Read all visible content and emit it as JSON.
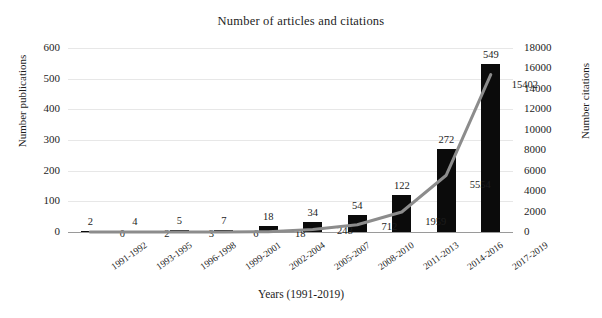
{
  "chart_data": {
    "type": "bar",
    "title": "Number of articles and citations",
    "xlabel": "Years (1991-2019)",
    "ylabel": "Number publications",
    "y2label": "Number citations",
    "categories": [
      "1991-1992",
      "1993-1995",
      "1996-1998",
      "1999-2001",
      "2002-2004",
      "2005-2007",
      "2008-2010",
      "2011-2013",
      "2014-2016",
      "2017-2019"
    ],
    "series": [
      {
        "name": "Number publications",
        "chart_type": "bar",
        "axis": "left",
        "color": "#0b0b0b",
        "values": [
          2,
          4,
          5,
          7,
          18,
          34,
          54,
          122,
          272,
          549
        ]
      },
      {
        "name": "Number citations",
        "chart_type": "line",
        "axis": "right",
        "color": "#8c8c8c",
        "values": [
          0,
          2,
          3,
          6,
          18,
          248,
          712,
          1959,
          5554,
          15402
        ]
      }
    ],
    "ylim": [
      0,
      600
    ],
    "yticks": [
      0,
      100,
      200,
      300,
      400,
      500,
      600
    ],
    "y2lim": [
      0,
      18000
    ],
    "y2ticks": [
      0,
      2000,
      4000,
      6000,
      8000,
      10000,
      12000,
      14000,
      16000,
      18000
    ],
    "grid": true,
    "legend": "none"
  }
}
